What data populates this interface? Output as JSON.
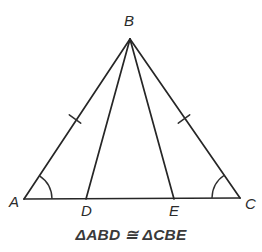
{
  "figure": {
    "type": "geometry-diagram",
    "shape": "isosceles-triangle-with-two-cevians",
    "caption": "ΔABD ≅ ΔCBE",
    "stroke_color": "#262626",
    "background_color": "#ffffff",
    "label_color": "#2b2b2b",
    "points": {
      "A": {
        "label": "A",
        "x": 24,
        "y": 199,
        "label_x": 9,
        "label_y": 207
      },
      "B": {
        "label": "B",
        "x": 130,
        "y": 39,
        "label_x": 124,
        "label_y": 26
      },
      "C": {
        "label": "C",
        "x": 240,
        "y": 198,
        "label_x": 245,
        "label_y": 209
      },
      "D": {
        "label": "D",
        "x": 86,
        "y": 199,
        "label_x": 81,
        "label_y": 216
      },
      "E": {
        "label": "E",
        "x": 174,
        "y": 199,
        "label_x": 169,
        "label_y": 216
      }
    },
    "segments": [
      {
        "name": "side-AB",
        "from": "A",
        "to": "B"
      },
      {
        "name": "side-BC",
        "from": "B",
        "to": "C"
      },
      {
        "name": "base-AC",
        "from": "A",
        "to": "C"
      },
      {
        "name": "cevian-BD",
        "from": "B",
        "to": "D"
      },
      {
        "name": "cevian-BE",
        "from": "B",
        "to": "E"
      }
    ],
    "tick_marks": [
      {
        "name": "congruence-tick-AB",
        "on": "side-AB",
        "count": 1,
        "x": 75,
        "y": 119
      },
      {
        "name": "congruence-tick-BC",
        "on": "side-BC",
        "count": 1,
        "x": 184,
        "y": 119
      }
    ],
    "angle_arcs": [
      {
        "name": "angle-arc-A",
        "at": "A",
        "radius": 28
      },
      {
        "name": "angle-arc-C",
        "at": "C",
        "radius": 28
      }
    ]
  }
}
